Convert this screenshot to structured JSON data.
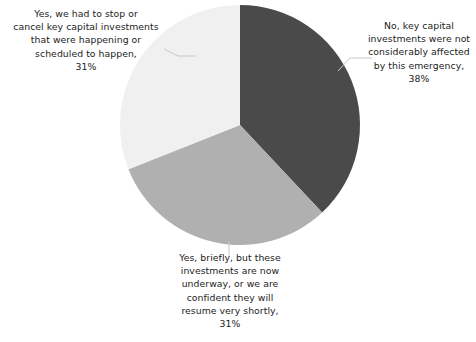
{
  "chart_data": {
    "type": "pie",
    "title": "",
    "subtitle": "",
    "xlabel": "",
    "ylabel": "",
    "legend_position": "none",
    "grid": false,
    "start_angle_deg": 0,
    "direction": "clockwise",
    "categories": [
      "No, key capital investments were not considerably affected by this emergency",
      "Yes, briefly, but these investments are now underway, or we are confident they will resume very shortly",
      "Yes, we had to stop or cancel key capital investments that were happening or scheduled to happen"
    ],
    "values": [
      38,
      31,
      31
    ],
    "value_unit": "%",
    "slices": [
      {
        "label": "No, key capital investments were not considerably affected by this emergency",
        "value": 38,
        "value_text": "38%",
        "color": "#4a4a4a",
        "start_angle_deg": 0,
        "end_angle_deg": 136.8
      },
      {
        "label": "Yes, briefly, but these investments are now underway, or we are confident they will resume very shortly",
        "value": 31,
        "value_text": "31%",
        "color": "#b0b0b0",
        "start_angle_deg": 136.8,
        "end_angle_deg": 248.4
      },
      {
        "label": "Yes, we had to stop or cancel key capital investments that were happening or scheduled to happen",
        "value": 31,
        "value_text": "31%",
        "color": "#f0f0f0",
        "start_angle_deg": 248.4,
        "end_angle_deg": 360
      }
    ]
  },
  "labels": {
    "left": "Yes, we had to stop or\ncancel key capital investments\nthat were happening or\nscheduled to happen,\n31%",
    "right": "No, key capital\ninvestments were not\nconsiderably affected\nby this emergency,\n38%",
    "bottom": "Yes, briefly, but these\ninvestments are now\nunderway, or we are\nconfident they will\nresume very shortly,\n31%"
  },
  "colors": {
    "slice_dark": "#4a4a4a",
    "slice_medium": "#b0b0b0",
    "slice_light": "#f0f0f0",
    "leader_line": "#c8c8c8",
    "text": "#1c1c1c",
    "background": "#ffffff"
  }
}
